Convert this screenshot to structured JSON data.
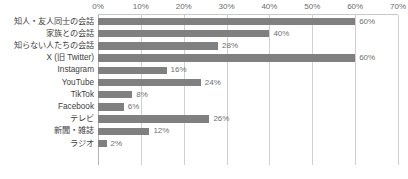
{
  "chart_data": {
    "type": "bar",
    "orientation": "horizontal",
    "title": "",
    "xlabel": "",
    "ylabel": "",
    "xlim": [
      0,
      70
    ],
    "x_tick_labels": [
      "0%",
      "10%",
      "20%",
      "30%",
      "40%",
      "50%",
      "60%",
      "70%"
    ],
    "x_ticks": [
      0,
      10,
      20,
      30,
      40,
      50,
      60,
      70
    ],
    "grid": true,
    "grid_axis": "x",
    "legend": false,
    "legend_position": "none",
    "bar_color": "#808080",
    "gridline_color": "#d0d0d0",
    "value_label_suffix": "%",
    "categories": [
      "知人・友人同士の会話",
      "家族との会話",
      "知らない人たちの会話",
      "X (旧 Twitter)",
      "Instagram",
      "YouTube",
      "TikTok",
      "Facebook",
      "テレビ",
      "新聞・雑誌",
      "ラジオ"
    ],
    "values": [
      60,
      40,
      28,
      60,
      16,
      24,
      8,
      6,
      26,
      12,
      2
    ],
    "value_labels": [
      "60%",
      "40%",
      "28%",
      "60%",
      "16%",
      "24%",
      "8%",
      "6%",
      "26%",
      "12%",
      "2%"
    ]
  }
}
